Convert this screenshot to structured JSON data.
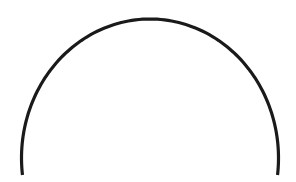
{
  "figure": {
    "shape": "semicircle-arc",
    "stroke_color": "#1a1a1a",
    "background_color": "#ffffff",
    "stroke_width": 3.2,
    "arc": {
      "center_x": 150,
      "center_y": 158,
      "radius_x": 128.5,
      "radius_y": 139,
      "start_x": 22.5,
      "start_y": 175,
      "end_x": 277.5,
      "end_y": 175
    }
  }
}
